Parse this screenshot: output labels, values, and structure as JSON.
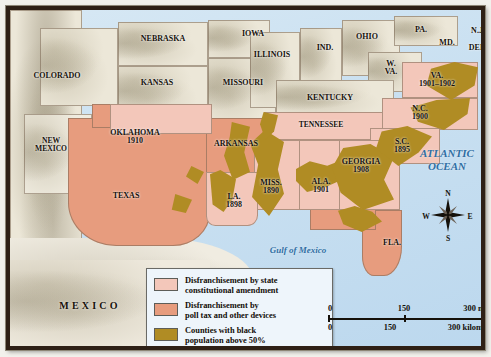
{
  "map": {
    "title_hidden": "Disfranchisement in the South",
    "states": [
      {
        "name": "COLORADO",
        "year": "",
        "x": 47,
        "y": 66
      },
      {
        "name": "NEBRASKA",
        "year": "",
        "x": 153,
        "y": 29
      },
      {
        "name": "IOWA",
        "year": "",
        "x": 243,
        "y": 24
      },
      {
        "name": "KANSAS",
        "year": "",
        "x": 147,
        "y": 73
      },
      {
        "name": "MISSOURI",
        "year": "",
        "x": 233,
        "y": 73
      },
      {
        "name": "ILLINOIS",
        "year": "",
        "x": 262,
        "y": 45
      },
      {
        "name": "IND.",
        "year": "",
        "x": 315,
        "y": 38
      },
      {
        "name": "OHIO",
        "year": "",
        "x": 357,
        "y": 27
      },
      {
        "name": "PA.",
        "year": "",
        "x": 411,
        "y": 20
      },
      {
        "name": "N.J.",
        "year": "",
        "x": 468,
        "y": 21
      },
      {
        "name": "MD.",
        "year": "",
        "x": 437,
        "y": 33
      },
      {
        "name": "DEL.",
        "year": "",
        "x": 468,
        "y": 38
      },
      {
        "name": "W.\nVA.",
        "year": "",
        "x": 381,
        "y": 58
      },
      {
        "name": "KENTUCKY",
        "year": "",
        "x": 320,
        "y": 88
      },
      {
        "name": "VA.",
        "year": "1901–1902",
        "x": 427,
        "y": 70
      },
      {
        "name": "N.C.",
        "year": "1900",
        "x": 410,
        "y": 103
      },
      {
        "name": "TENNESSEE",
        "year": "",
        "x": 311,
        "y": 115
      },
      {
        "name": "OKLAHOMA",
        "year": "1910",
        "x": 125,
        "y": 127
      },
      {
        "name": "ARKANSAS",
        "year": "",
        "x": 226,
        "y": 134
      },
      {
        "name": "NEW\nMEXICO",
        "year": "",
        "x": 41,
        "y": 135
      },
      {
        "name": "S.C.",
        "year": "1895",
        "x": 392,
        "y": 136
      },
      {
        "name": "GEORGIA",
        "year": "1908",
        "x": 351,
        "y": 156
      },
      {
        "name": "MISS.",
        "year": "1890",
        "x": 261,
        "y": 177
      },
      {
        "name": "ALA.",
        "year": "1901",
        "x": 311,
        "y": 176
      },
      {
        "name": "LA.",
        "year": "1898",
        "x": 224,
        "y": 191
      },
      {
        "name": "TEXAS",
        "year": "",
        "x": 116,
        "y": 186
      },
      {
        "name": "FLA.",
        "year": "",
        "x": 382,
        "y": 233
      }
    ],
    "water_labels": [
      {
        "text": "ATLANTIC\nOCEAN",
        "x": 437,
        "y": 150,
        "size": 11
      },
      {
        "text": "Gulf of Mexico",
        "x": 288,
        "y": 240,
        "size": 9
      }
    ],
    "country_label": {
      "text": "MEXICO",
      "x": 80,
      "y": 295
    }
  },
  "legend": {
    "items": [
      {
        "color": "#f3c7ba",
        "label": "Disfranchisement by state\nconstitutional amendment",
        "key": "amendment"
      },
      {
        "color": "#e79c7e",
        "label": "Disfranchisement by\npoll tax and other devices",
        "key": "poll-tax"
      },
      {
        "color": "#b08c24",
        "label": "Counties with black\npopulation above 50%",
        "key": "black-majority-counties"
      }
    ]
  },
  "scale": {
    "miles": {
      "ticks": [
        "0",
        "150",
        "300 miles"
      ]
    },
    "kilometers": {
      "ticks": [
        "0",
        "150",
        "300 kilometers"
      ]
    }
  },
  "compass": {
    "north": "N",
    "east": "E",
    "south": "S",
    "west": "W"
  }
}
